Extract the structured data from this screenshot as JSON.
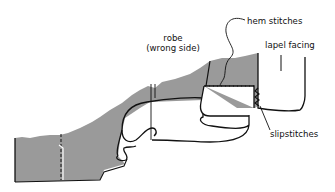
{
  "diagram": {
    "colors": {
      "fabric_wrong_side": "#9a9a9a",
      "line": "#111111",
      "background": "#ffffff"
    },
    "labels": {
      "robe_line1": "robe",
      "robe_line2": "(wrong side)",
      "hem_stitches": "hem stitches",
      "lapel_facing": "lapel facing",
      "slipstitches": "slipstitches"
    }
  }
}
